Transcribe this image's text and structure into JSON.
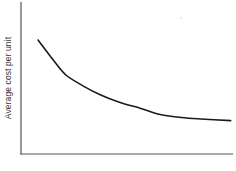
{
  "chart_data": {
    "type": "line",
    "title": "",
    "xlabel": "",
    "ylabel": "Average cost per unit",
    "grid": false,
    "legend": null,
    "x_ticks": [],
    "y_ticks": [],
    "series": [
      {
        "name": "Average cost per unit",
        "x": [
          0.08,
          0.15,
          0.21,
          0.3,
          0.37,
          0.46,
          0.56,
          0.65,
          0.75,
          0.84,
          0.98
        ],
        "values": [
          0.75,
          0.62,
          0.52,
          0.44,
          0.39,
          0.34,
          0.3,
          0.26,
          0.24,
          0.23,
          0.22
        ]
      }
    ],
    "xlim": [
      0,
      1
    ],
    "ylim": [
      0,
      1
    ]
  },
  "colors": {
    "axis": "#555555",
    "curve": "#1a1a1a",
    "text": "#333333",
    "background": "#ffffff"
  }
}
